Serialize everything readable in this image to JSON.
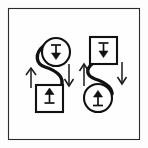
{
  "figure": {
    "title": "Two-stage transfer diagram",
    "background_color": "#fdfdfd",
    "frame": {
      "name": "outer-border-frame",
      "stroke_color": "#2b2b2b",
      "x": 8,
      "y": 8,
      "width": 132,
      "height": 132
    },
    "ink_color": "#111111",
    "groups": [
      {
        "id": "left-group",
        "label": "Left pair",
        "source": {
          "shape": "circle",
          "name": "left-source-circle",
          "cx": 56,
          "cy": 52,
          "r": 14,
          "glyph": "down-arrow-to-bar-icon",
          "glyph_orientation": "upright"
        },
        "target": {
          "shape": "square",
          "name": "left-target-square",
          "x": 36,
          "y": 85,
          "size": 27,
          "glyph": "down-arrow-to-bar-icon",
          "glyph_orientation": "inverted"
        },
        "connector": {
          "name": "left-s-curve-connector",
          "style": "s-curve",
          "stroke_width": 3.4
        },
        "arrows": [
          {
            "name": "left-group-up-arrow",
            "direction": "up",
            "x": 31,
            "y_top": 68,
            "y_bottom": 88
          },
          {
            "name": "left-group-down-arrow",
            "direction": "down",
            "x": 69,
            "y_top": 64,
            "y_bottom": 86
          }
        ]
      },
      {
        "id": "right-group",
        "label": "Right pair",
        "source": {
          "shape": "square",
          "name": "right-source-square",
          "x": 90,
          "y": 37,
          "size": 27,
          "glyph": "down-arrow-to-bar-icon",
          "glyph_orientation": "upright"
        },
        "target": {
          "shape": "circle",
          "name": "right-target-circle",
          "cx": 98,
          "cy": 98,
          "r": 14,
          "glyph": "down-arrow-to-bar-icon",
          "glyph_orientation": "inverted"
        },
        "connector": {
          "name": "right-s-curve-connector",
          "style": "s-curve",
          "stroke_width": 3.4
        },
        "arrows": [
          {
            "name": "right-group-up-arrow",
            "direction": "up",
            "x": 84,
            "y_top": 64,
            "y_bottom": 86
          },
          {
            "name": "right-group-down-arrow",
            "direction": "down",
            "x": 122,
            "y_top": 62,
            "y_bottom": 84
          }
        ]
      }
    ],
    "glyph_legend": {
      "down-arrow-to-bar-icon": "vertical bar above a solid downward triangle arrowhead"
    }
  }
}
